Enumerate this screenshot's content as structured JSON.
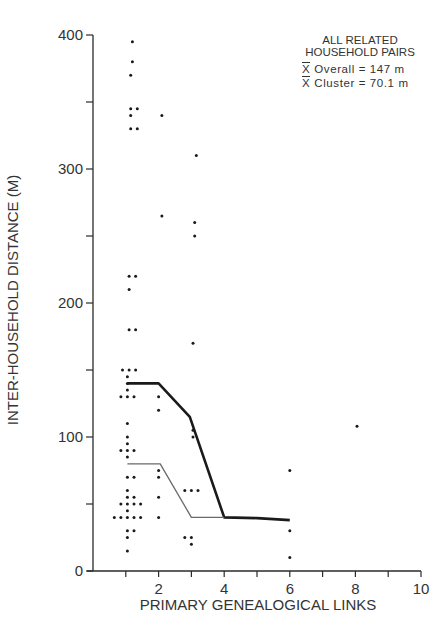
{
  "chart_data": {
    "type": "scatter",
    "title": "",
    "xlabel": "PRIMARY GENEALOGICAL LINKS",
    "ylabel": "INTER-HOUSEHOLD DISTANCE (M)",
    "xlim": [
      0,
      10
    ],
    "ylim": [
      0,
      400
    ],
    "grid": false,
    "x_ticks": [
      1,
      2,
      3,
      4,
      5,
      6,
      7,
      8,
      9,
      10
    ],
    "x_tick_labels": [
      "",
      "2",
      "",
      "4",
      "",
      "6",
      "",
      "8",
      "",
      "10"
    ],
    "y_ticks": [
      0,
      50,
      100,
      150,
      200,
      250,
      300,
      350,
      400
    ],
    "y_tick_labels": [
      "0",
      "",
      "100",
      "",
      "200",
      "",
      "300",
      "",
      "400"
    ],
    "legend": {
      "position": "top-right",
      "title_lines": [
        "ALL RELATED",
        "HOUSEHOLD PAIRS"
      ],
      "stats": [
        {
          "symbol": "X",
          "label": "Overall",
          "value": "147 m"
        },
        {
          "symbol": "X",
          "label": "Cluster",
          "value": "70.1 m"
        }
      ]
    },
    "series": [
      {
        "name": "household pairs",
        "kind": "points",
        "points": [
          [
            1.2,
            395
          ],
          [
            1.2,
            380
          ],
          [
            1.15,
            370
          ],
          [
            1.15,
            345
          ],
          [
            1.35,
            345
          ],
          [
            1.15,
            340
          ],
          [
            1.15,
            330
          ],
          [
            1.35,
            330
          ],
          [
            1.1,
            220
          ],
          [
            1.3,
            220
          ],
          [
            1.1,
            210
          ],
          [
            1.1,
            180
          ],
          [
            1.3,
            180
          ],
          [
            0.9,
            150
          ],
          [
            1.1,
            150
          ],
          [
            1.3,
            150
          ],
          [
            1.05,
            145
          ],
          [
            1.05,
            140
          ],
          [
            1.05,
            135
          ],
          [
            0.85,
            130
          ],
          [
            1.05,
            130
          ],
          [
            1.25,
            130
          ],
          [
            1.05,
            110
          ],
          [
            1.05,
            100
          ],
          [
            1.05,
            95
          ],
          [
            0.85,
            90
          ],
          [
            1.05,
            90
          ],
          [
            1.25,
            90
          ],
          [
            1.05,
            85
          ],
          [
            1.05,
            70
          ],
          [
            1.25,
            70
          ],
          [
            1.05,
            60
          ],
          [
            1.05,
            55
          ],
          [
            1.25,
            55
          ],
          [
            0.85,
            50
          ],
          [
            1.05,
            50
          ],
          [
            1.25,
            50
          ],
          [
            1.45,
            50
          ],
          [
            1.05,
            45
          ],
          [
            0.65,
            40
          ],
          [
            0.85,
            40
          ],
          [
            1.05,
            40
          ],
          [
            1.25,
            40
          ],
          [
            1.45,
            40
          ],
          [
            1.05,
            30
          ],
          [
            1.25,
            30
          ],
          [
            1.05,
            25
          ],
          [
            1.05,
            15
          ],
          [
            2.1,
            340
          ],
          [
            2.1,
            265
          ],
          [
            2.0,
            130
          ],
          [
            2.0,
            120
          ],
          [
            2.0,
            75
          ],
          [
            2.0,
            70
          ],
          [
            2.0,
            55
          ],
          [
            2.0,
            40
          ],
          [
            3.15,
            310
          ],
          [
            3.1,
            260
          ],
          [
            3.1,
            250
          ],
          [
            3.05,
            170
          ],
          [
            3.05,
            105
          ],
          [
            3.05,
            100
          ],
          [
            2.8,
            60
          ],
          [
            3.0,
            60
          ],
          [
            3.2,
            60
          ],
          [
            2.8,
            25
          ],
          [
            3.0,
            25
          ],
          [
            3.0,
            20
          ],
          [
            6.0,
            75
          ],
          [
            6.0,
            30
          ],
          [
            6.0,
            10
          ],
          [
            8.05,
            108
          ]
        ]
      },
      {
        "name": "mean distance (all pairs)",
        "kind": "line",
        "stroke": "#1a1a1a",
        "width": 2.6,
        "points": [
          [
            1.05,
            140
          ],
          [
            2.0,
            140
          ],
          [
            2.95,
            115
          ],
          [
            4.0,
            40
          ],
          [
            5.0,
            39.5
          ],
          [
            6.0,
            38
          ]
        ]
      },
      {
        "name": "mean distance (cluster)",
        "kind": "line",
        "stroke": "#6a6a6a",
        "width": 1.3,
        "points": [
          [
            1.05,
            80
          ],
          [
            2.05,
            80
          ],
          [
            3.0,
            40
          ],
          [
            4.0,
            40
          ]
        ]
      }
    ],
    "plot_area_px": {
      "x0": 93,
      "y0": 571,
      "px_per_x": 32.8,
      "px_per_y": 1.34
    }
  }
}
